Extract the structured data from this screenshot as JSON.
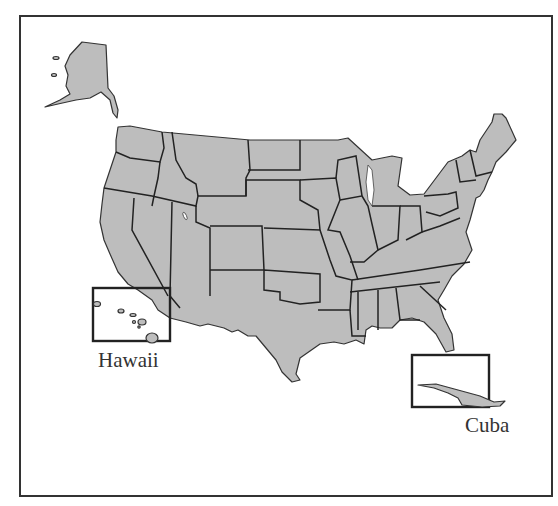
{
  "map": {
    "title": "United States map with Hawaii and Cuba insets",
    "fill_color": "#bdbdbd",
    "border_color": "#222222",
    "background": "#ffffff",
    "insets": [
      {
        "id": "hawaii",
        "label": "Hawaii",
        "box": {
          "x": 93,
          "y": 288,
          "w": 77,
          "h": 53
        }
      },
      {
        "id": "cuba",
        "label": "Cuba",
        "box": {
          "x": 412,
          "y": 355,
          "w": 77,
          "h": 52
        }
      }
    ],
    "regions": [
      "Alaska",
      "Contiguous United States",
      "Hawaii",
      "Cuba"
    ]
  }
}
